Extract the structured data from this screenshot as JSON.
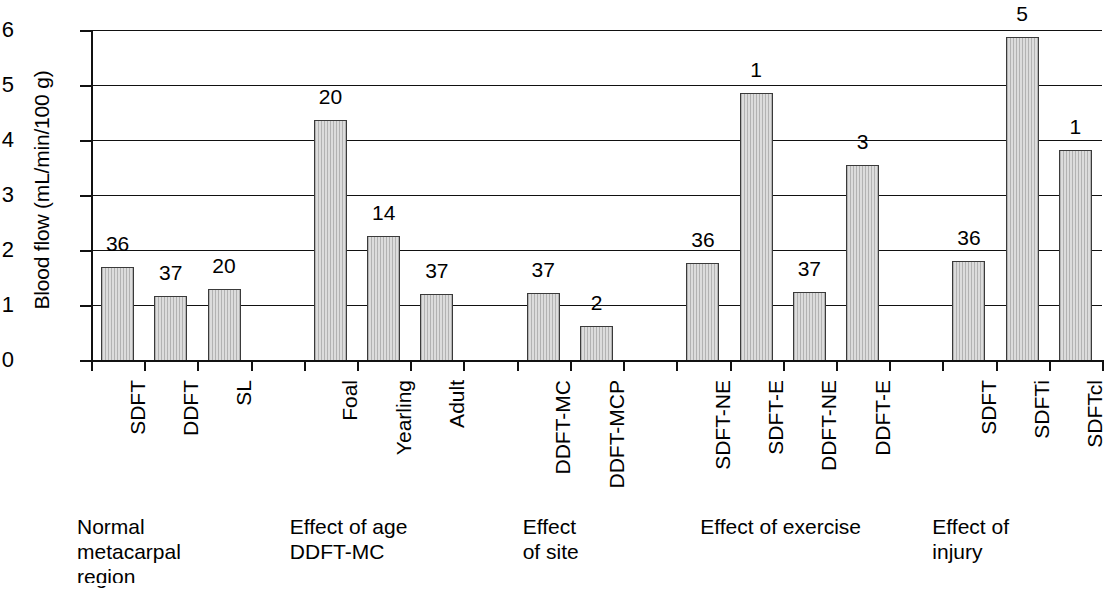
{
  "chart_data": {
    "type": "bar",
    "title": "",
    "xlabel": "",
    "ylabel": "Blood flow (mL/min/100 g)",
    "ylim": [
      0,
      6
    ],
    "yticks": [
      "0",
      "1",
      "2",
      "3",
      "4",
      "5",
      "6"
    ],
    "grid": true,
    "legend": null,
    "categories": [
      "SDFT",
      "DDFT",
      "SL",
      "Foal",
      "Yearling",
      "Adult",
      "DDFT-MC",
      "DDFT-MCP",
      "SDFT-NE",
      "SDFT-E",
      "DDFT-NE",
      "DDFT-E",
      "SDFT",
      "SDFTi",
      "SDFTcl"
    ],
    "values": [
      1.7,
      1.16,
      1.3,
      4.37,
      2.25,
      1.2,
      1.21,
      0.61,
      1.77,
      4.85,
      1.24,
      3.55,
      1.8,
      5.87,
      3.82
    ],
    "point_labels": [
      "36",
      "37",
      "20",
      "20",
      "14",
      "37",
      "37",
      "2",
      "36",
      "1",
      "37",
      "3",
      "36",
      "5",
      "1"
    ],
    "groups": [
      {
        "caption": "Normal\nmetacarpal\nregion",
        "categories": [
          "SDFT",
          "DDFT",
          "SL"
        ]
      },
      {
        "caption": "Effect of age\nDDFT-MC",
        "categories": [
          "Foal",
          "Yearling",
          "Adult"
        ]
      },
      {
        "caption": "Effect\nof site",
        "categories": [
          "DDFT-MC",
          "DDFT-MCP"
        ]
      },
      {
        "caption": "Effect of exercise",
        "categories": [
          "SDFT-NE",
          "SDFT-E",
          "DDFT-NE",
          "DDFT-E"
        ]
      },
      {
        "caption": "Effect of\ninjury",
        "categories": [
          "SDFT",
          "SDFTi",
          "SDFTcl"
        ]
      }
    ],
    "colors": {
      "bar_fill": "#dcdcdc",
      "bar_border": "#3a3a3a",
      "axis": "#111111",
      "text": "#000000",
      "background": "#ffffff"
    }
  }
}
